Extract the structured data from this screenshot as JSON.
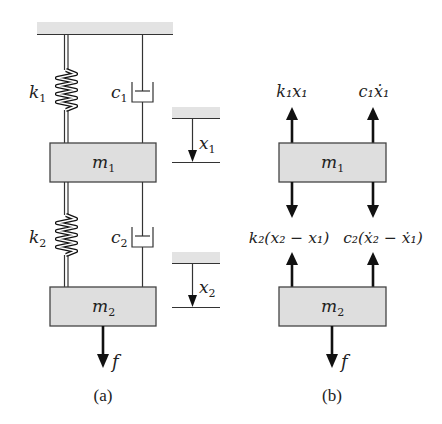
{
  "figure": {
    "panel_a": {
      "caption": "(a)",
      "spring_1": {
        "symbol": "k",
        "sub": "1"
      },
      "damper_1": {
        "symbol": "c",
        "sub": "1"
      },
      "mass_1": {
        "symbol": "m",
        "sub": "1"
      },
      "spring_2": {
        "symbol": "k",
        "sub": "2"
      },
      "damper_2": {
        "symbol": "c",
        "sub": "2"
      },
      "mass_2": {
        "symbol": "m",
        "sub": "2"
      },
      "displacement_1": {
        "symbol": "x",
        "sub": "1"
      },
      "displacement_2": {
        "symbol": "x",
        "sub": "2"
      },
      "force": {
        "symbol": "f"
      }
    },
    "panel_b": {
      "caption": "(b)",
      "mass_1": {
        "symbol": "m",
        "sub": "1"
      },
      "mass_2": {
        "symbol": "m",
        "sub": "2"
      },
      "force_spring_1": "k₁x₁",
      "force_damper_1": "c₁ẋ₁",
      "force_spring_2": "k₂(x₂ − x₁)",
      "force_damper_2": "c₂(ẋ₂ − ẋ₁)",
      "force": {
        "symbol": "f"
      }
    },
    "colors": {
      "mass_fill": "#dedede",
      "ground_fill": "#e3e3e3",
      "line": "#333333"
    }
  }
}
